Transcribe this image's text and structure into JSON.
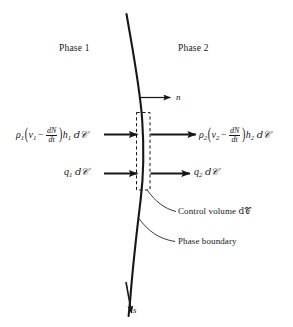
{
  "figure": {
    "background_color": "#ffffff",
    "ink_color": "#17171a"
  },
  "regions": {
    "left_label": "Phase 1",
    "right_label": "Phase 2"
  },
  "vectors": {
    "normal": "n",
    "tangent": "s"
  },
  "fluxes": {
    "enthalpy_left": {
      "rho": "ρ",
      "rho_sub": "1",
      "v": "v",
      "v_sub": "1",
      "minus": "−",
      "frac_num": "dN",
      "frac_den": "dt",
      "h": "h",
      "h_sub": "1",
      "area": "d𝒞",
      "plain": "ρ₁(v₁ − dN/dt)h₁ d𝒞"
    },
    "enthalpy_right": {
      "rho": "ρ",
      "rho_sub": "2",
      "v": "v",
      "v_sub": "2",
      "minus": "−",
      "frac_num": "dN",
      "frac_den": "dt",
      "h": "h",
      "h_sub": "2",
      "area": "d𝒞",
      "plain": "ρ₂(v₂ − dN/dt)h₂ d𝒞"
    },
    "heat_left": {
      "q": "q",
      "q_sub": "1",
      "area": "d𝒞",
      "plain": "q₁ d𝒞"
    },
    "heat_right": {
      "q": "q",
      "q_sub": "2",
      "area": "d𝒞",
      "plain": "q₂ d𝒞"
    }
  },
  "annotations": {
    "control_volume": {
      "text": "Control volume ",
      "symbol": "d𝒞"
    },
    "phase_boundary": {
      "text": "Phase boundary"
    }
  }
}
